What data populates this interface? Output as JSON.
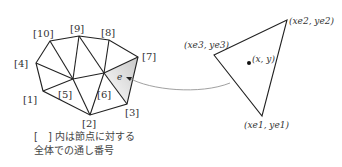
{
  "mesh": {
    "node_labels": {
      "n1": "[1]",
      "n2": "[2]",
      "n3": "[3]",
      "n4": "[4]",
      "n5": "[5]",
      "n6": "[6]",
      "n7": "[7]",
      "n8": "[8]",
      "n9": "[9]",
      "n10": "[10]"
    },
    "element_label": "e"
  },
  "element": {
    "vertex1": "(xe1, ye1)",
    "vertex2": "(xe2, ye2)",
    "vertex3": "(xe3, ye3)",
    "point": "(x, y)"
  },
  "caption": {
    "line1": "[　] 内は節点に対する",
    "line2": "全体での通し番号"
  }
}
